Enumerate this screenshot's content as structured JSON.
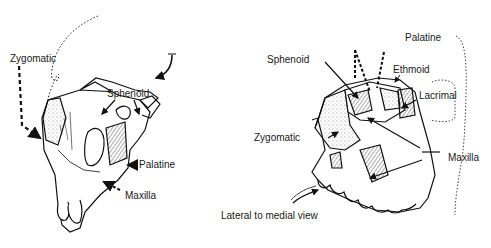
{
  "left_view": {
    "labels": {
      "zygomatic": "Zygomatic",
      "sphenoid": "Sphenoid",
      "palatine": "Palatine",
      "maxilla": "Maxilla"
    }
  },
  "right_view": {
    "labels": {
      "palatine": "Palatine",
      "sphenoid": "Sphenoid",
      "ethmoid": "Ethmoid",
      "lacrimal": "Lacrimal",
      "zygomatic": "Zygomatic",
      "maxilla": "Maxilla"
    },
    "caption": "Lateral to medial view"
  },
  "colors": {
    "ink": "#1a1a1a",
    "background": "#ffffff",
    "stipple": "#777777"
  }
}
